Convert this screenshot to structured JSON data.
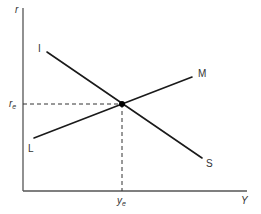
{
  "diagram": {
    "type": "IS-LM model",
    "axes": {
      "y_axis_label": "r",
      "x_axis_label": "Y"
    },
    "curves": [
      {
        "name": "IS",
        "start_label": "I",
        "end_label": "S",
        "slope": "downward"
      },
      {
        "name": "LM",
        "start_label": "L",
        "end_label": "M",
        "slope": "upward"
      }
    ],
    "equilibrium": {
      "r_label_base": "r",
      "r_label_sub": "e",
      "y_label_base": "y",
      "y_label_sub": "e"
    },
    "colors": {
      "line": "#1a1a1a",
      "axis": "#555555",
      "background": "#ffffff"
    }
  }
}
